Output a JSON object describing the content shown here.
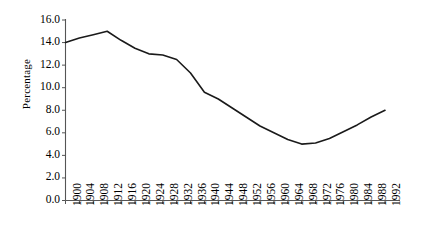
{
  "chart_data": {
    "type": "line",
    "title": "",
    "xlabel": "",
    "ylabel": "Percentage",
    "xlim": [
      1900,
      1992
    ],
    "ylim": [
      0.0,
      16.0
    ],
    "grid": false,
    "legend": null,
    "yticks": [
      "0.0",
      "2.0",
      "4.0",
      "6.0",
      "8.0",
      "10.0",
      "12.0",
      "14.0",
      "16.0"
    ],
    "ytick_values": [
      0.0,
      2.0,
      4.0,
      6.0,
      8.0,
      10.0,
      12.0,
      14.0,
      16.0
    ],
    "categories": [
      "1900",
      "1904",
      "1908",
      "1912",
      "1916",
      "1920",
      "1924",
      "1928",
      "1932",
      "1936",
      "1940",
      "1944",
      "1948",
      "1952",
      "1956",
      "1960",
      "1964",
      "1968",
      "1972",
      "1976",
      "1980",
      "1984",
      "1988",
      "1992"
    ],
    "x": [
      1900,
      1904,
      1908,
      1912,
      1916,
      1920,
      1924,
      1928,
      1932,
      1936,
      1940,
      1944,
      1948,
      1952,
      1956,
      1960,
      1964,
      1968,
      1972,
      1976,
      1980,
      1984,
      1988,
      1992
    ],
    "values": [
      14.0,
      14.4,
      14.7,
      15.0,
      14.2,
      13.5,
      13.0,
      12.9,
      12.5,
      11.3,
      9.6,
      9.0,
      8.2,
      7.4,
      6.6,
      6.0,
      5.4,
      5.0,
      5.1,
      5.5,
      6.1,
      6.7,
      7.4,
      8.0
    ],
    "line_color": "#1a1a1a",
    "line_width": 1.6,
    "markers": false,
    "axis_color": "#555555",
    "background": "#ffffff"
  }
}
